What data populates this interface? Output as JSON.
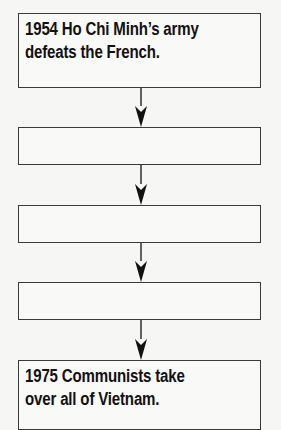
{
  "flowchart": {
    "direction": "top-to-bottom",
    "colors": {
      "background": "#f6f6f4",
      "box_fill": "#f9f9f8",
      "box_border": "#3a3a3a",
      "text": "#111111",
      "arrow": "#111111"
    },
    "boxes": [
      {
        "line1": "1954  Ho Chi Minh’s army",
        "line2": "defeats the French."
      },
      {
        "line1": "",
        "line2": ""
      },
      {
        "line1": "",
        "line2": ""
      },
      {
        "line1": "",
        "line2": ""
      },
      {
        "line1": "1975  Communists take",
        "line2": "over all of Vietnam."
      }
    ],
    "arrows": [
      {
        "from": 0,
        "to": 1
      },
      {
        "from": 1,
        "to": 2
      },
      {
        "from": 2,
        "to": 3
      },
      {
        "from": 3,
        "to": 4
      }
    ]
  }
}
